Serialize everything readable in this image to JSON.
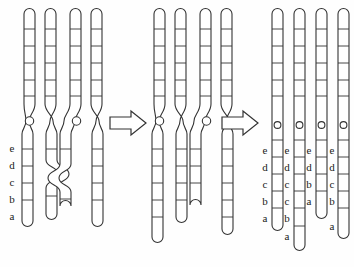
{
  "figure": {
    "background_color": "#fefefe",
    "line_color": "#333333",
    "label_color": "#1a1a1a"
  },
  "stages": [
    {
      "name": "stage-1-tetrad-with-chiasma",
      "caption": "",
      "chromatid_count": 4,
      "has_chiasma": true,
      "labels": [
        "e",
        "d",
        "c",
        "b",
        "a"
      ]
    },
    {
      "name": "stage-2-after-exchange",
      "caption": "",
      "chromatid_count": 4,
      "has_chiasma": true,
      "labels": []
    },
    {
      "name": "stage-3-separated-chromatids",
      "caption": "",
      "chromatid_count": 4,
      "has_chiasma": false,
      "labels": []
    }
  ],
  "arrows": [
    {
      "name": "arrow-1",
      "glyph": "right-block-arrow"
    },
    {
      "name": "arrow-2",
      "glyph": "right-block-arrow"
    }
  ],
  "left_axis_labels": {
    "name": "left-locus-labels",
    "values": [
      "e",
      "d",
      "c",
      "b",
      "a"
    ]
  },
  "result_columns": [
    {
      "name": "result-chromatid-1",
      "labels": [
        "e",
        "d",
        "c",
        "b",
        "a"
      ]
    },
    {
      "name": "result-chromatid-2",
      "labels": [
        "e",
        "d",
        "c",
        "c",
        "b",
        "a"
      ]
    },
    {
      "name": "result-chromatid-3",
      "labels": [
        "e",
        "d",
        "b",
        "a"
      ]
    },
    {
      "name": "result-chromatid-4",
      "labels": [
        "e",
        "d",
        "c",
        "b",
        "a"
      ]
    }
  ]
}
